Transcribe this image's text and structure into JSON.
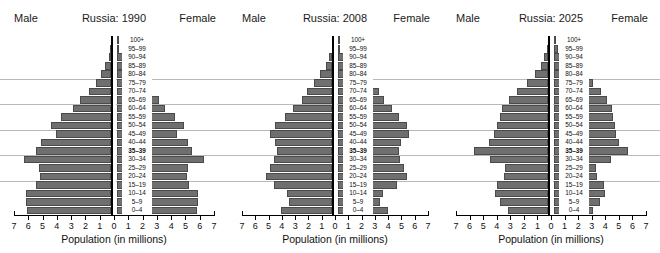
{
  "figure": {
    "width": 660,
    "height": 253,
    "bar_color": "#6f6f6f",
    "bar_edge_color": "#4a4a4a",
    "grid_color": "#b9b9b9",
    "axis_color": "#000000",
    "background": "#ffffff"
  },
  "labels": {
    "male": "Male",
    "female": "Female",
    "xaxis_title": "Population (in millions)"
  },
  "age_groups": [
    "100+",
    "95–99",
    "90–94",
    "85–89",
    "80–84",
    "75–79",
    "70–74",
    "65–69",
    "60–64",
    "55–59",
    "50–54",
    "45–49",
    "40–44",
    "35–39",
    "30–34",
    "25–29",
    "20–24",
    "15–19",
    "10–14",
    "5–9",
    "0–4"
  ],
  "emphasized_age_group": "35–39",
  "xticks": [
    7,
    6,
    5,
    4,
    3,
    2,
    1,
    0,
    1,
    2,
    3,
    4,
    5,
    6,
    7
  ],
  "xtick_labels": [
    "7",
    "6",
    "5",
    "4",
    "3",
    "2",
    "1",
    "0",
    "1",
    "2",
    "3",
    "4",
    "5",
    "6",
    "7"
  ],
  "gridline_age_groups": [
    "75–79",
    "60–64",
    "45–49",
    "30–34",
    "15–19"
  ],
  "chart_data": [
    {
      "type": "bar",
      "title": "Russia: 1990",
      "subtype": "population-pyramid",
      "xlabel": "Population (in millions)",
      "ylabel": "",
      "xlim": [
        -7,
        7
      ],
      "grid": true,
      "legend_position": "none",
      "categories": [
        "100+",
        "95–99",
        "90–94",
        "85–89",
        "80–84",
        "75–79",
        "70–74",
        "65–69",
        "60–64",
        "55–59",
        "50–54",
        "45–49",
        "40–44",
        "35–39",
        "30–34",
        "25–29",
        "20–24",
        "15–19",
        "10–14",
        "5–9",
        "0–4"
      ],
      "series": [
        {
          "name": "Male",
          "values": [
            0.02,
            0.08,
            0.2,
            0.45,
            0.75,
            1.1,
            1.6,
            2.2,
            2.7,
            3.5,
            4.2,
            3.9,
            4.9,
            5.3,
            6.1,
            5.1,
            5.0,
            5.3,
            6.0,
            6.0,
            5.9
          ]
        },
        {
          "name": "Female",
          "values": [
            0.05,
            0.2,
            0.45,
            0.85,
            1.3,
            1.8,
            2.3,
            3.0,
            3.4,
            4.1,
            4.7,
            4.2,
            5.0,
            5.3,
            6.1,
            5.0,
            4.9,
            5.1,
            5.7,
            5.7,
            5.6
          ]
        }
      ]
    },
    {
      "type": "bar",
      "title": "Russia: 2008",
      "subtype": "population-pyramid",
      "xlabel": "Population (in millions)",
      "ylabel": "",
      "xlim": [
        -7,
        7
      ],
      "grid": true,
      "legend_position": "none",
      "categories": [
        "100+",
        "95–99",
        "90–94",
        "85–89",
        "80–84",
        "75–79",
        "70–74",
        "65–69",
        "60–64",
        "55–59",
        "50–54",
        "45–49",
        "40–44",
        "35–39",
        "30–34",
        "25–29",
        "20–24",
        "15–19",
        "10–14",
        "5–9",
        "0–4"
      ],
      "series": [
        {
          "name": "Male",
          "values": [
            0.01,
            0.05,
            0.25,
            0.5,
            0.9,
            1.4,
            1.9,
            2.3,
            3.0,
            3.6,
            4.3,
            4.7,
            4.3,
            4.2,
            4.4,
            4.7,
            5.0,
            4.4,
            3.4,
            3.3,
            3.9
          ]
        },
        {
          "name": "Female",
          "values": [
            0.03,
            0.15,
            0.6,
            1.1,
            1.8,
            2.5,
            3.1,
            3.5,
            4.1,
            4.6,
            5.2,
            5.4,
            4.8,
            4.6,
            4.7,
            5.0,
            5.2,
            4.5,
            3.4,
            3.2,
            3.8
          ]
        }
      ]
    },
    {
      "type": "bar",
      "title": "Russia: 2025",
      "subtype": "population-pyramid",
      "xlabel": "Population (in millions)",
      "ylabel": "",
      "xlim": [
        -7,
        7
      ],
      "grid": true,
      "legend_position": "none",
      "categories": [
        "100+",
        "95–99",
        "90–94",
        "85–89",
        "80–84",
        "75–79",
        "70–74",
        "65–69",
        "60–64",
        "55–59",
        "50–54",
        "45–49",
        "40–44",
        "35–39",
        "30–34",
        "25–29",
        "20–24",
        "15–19",
        "10–14",
        "5–9",
        "0–4"
      ],
      "series": [
        {
          "name": "Male",
          "values": [
            0.02,
            0.1,
            0.3,
            0.55,
            1.0,
            1.6,
            2.3,
            2.9,
            3.4,
            3.6,
            3.8,
            4.0,
            4.4,
            5.5,
            4.3,
            3.2,
            3.3,
            3.8,
            3.9,
            3.6,
            3.0
          ]
        },
        {
          "name": "Female",
          "values": [
            0.06,
            0.3,
            0.8,
            1.4,
            2.2,
            2.9,
            3.5,
            3.9,
            4.3,
            4.4,
            4.5,
            4.6,
            4.8,
            5.5,
            4.2,
            3.1,
            3.2,
            3.7,
            3.8,
            3.4,
            2.9
          ]
        }
      ]
    }
  ]
}
